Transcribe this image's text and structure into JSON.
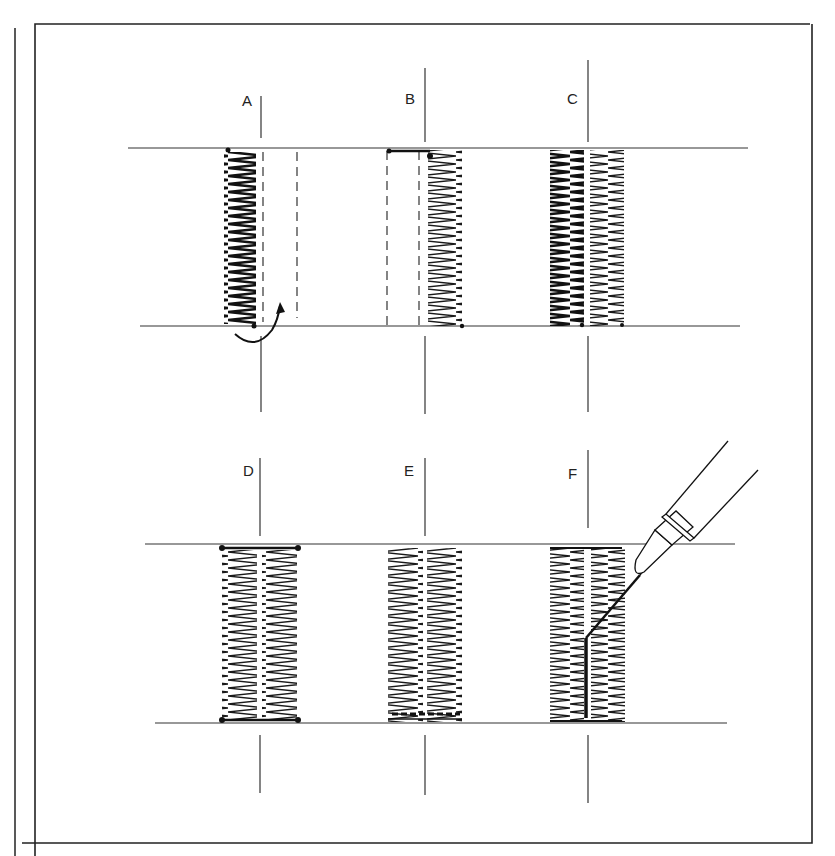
{
  "figure": {
    "type": "sewing/stitching diagram",
    "panels": [
      {
        "label": "A",
        "description": "single zigzag column with dashed guide lines and curved pivot arrow"
      },
      {
        "label": "B",
        "description": "second zigzag column stitched beside dashed lines"
      },
      {
        "label": "C",
        "description": "two zigzag columns side by side"
      },
      {
        "label": "D",
        "description": "two columns with bar-tacked ends"
      },
      {
        "label": "E",
        "description": "two columns with reinforced bottom bar"
      },
      {
        "label": "F",
        "description": "seam ripper cutting between the columns"
      }
    ]
  },
  "colors": {
    "ink": "#1a1a1a",
    "paper": "#ffffff",
    "rule": "#333333"
  }
}
